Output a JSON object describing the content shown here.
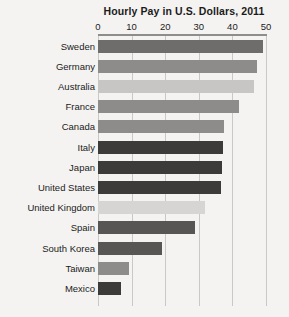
{
  "chart_data": {
    "type": "bar",
    "title": "Hourly Pay in U.S. Dollars, 2011",
    "xlabel": "",
    "ylabel": "",
    "orientation": "horizontal",
    "xlim": [
      0,
      50
    ],
    "xticks": [
      0,
      10,
      20,
      30,
      40,
      50
    ],
    "xtick_labels": [
      "0",
      "10",
      "20",
      "30",
      "40",
      "50"
    ],
    "grid": true,
    "legend": "none",
    "categories": [
      "Sweden",
      "Germany",
      "Australia",
      "France",
      "Canada",
      "Italy",
      "Japan",
      "United States",
      "United Kingdom",
      "Spain",
      "South Korea",
      "Taiwan",
      "Mexico"
    ],
    "values": [
      49.1,
      47.4,
      46.3,
      42.1,
      37.4,
      37.1,
      37.0,
      36.7,
      31.9,
      29.0,
      19.0,
      9.3,
      6.7
    ],
    "bar_colors": [
      "#6e6d6b",
      "#8d8c8a",
      "#c7c6c4",
      "#8d8c8a",
      "#8d8c8a",
      "#3c3b3a",
      "#3c3b3a",
      "#3c3b3a",
      "#d6d5d3",
      "#575654",
      "#575654",
      "#8d8c8a",
      "#3c3b3a"
    ],
    "background_color": "#f4f3f1",
    "gridline_color": "#c9c8c6",
    "axis_rule_color": "#8e8d8b"
  }
}
